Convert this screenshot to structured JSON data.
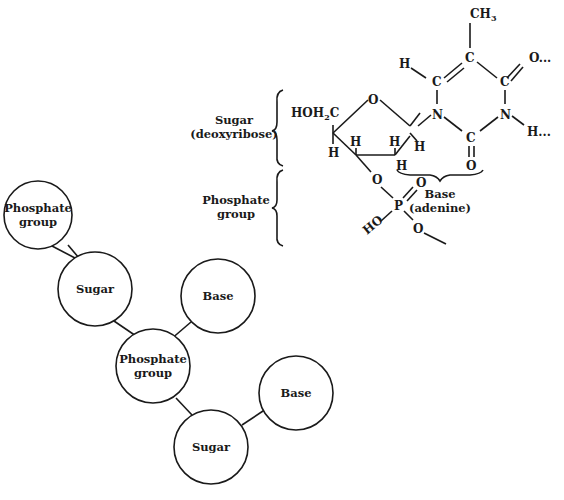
{
  "structural_formula": {
    "labels": {
      "sugar_line1": "Sugar",
      "sugar_line2": "(deoxyribose)",
      "phosphate_line1": "Phosphate",
      "phosphate_line2": "group",
      "base_line1": "Base",
      "base_line2": "(adenine)"
    },
    "atoms": {
      "hoh2c_a": "HOH",
      "hoh2c_sub": "2",
      "hoh2c_b": "C",
      "ring_o": "O",
      "h_c4_down": "H",
      "h_c3": "H",
      "h_c2_up": "H",
      "h_c2_down": "H",
      "h_c1": "H",
      "o3": "O",
      "p": "P",
      "p_o_double": "O",
      "ho": "HO",
      "o5": "O",
      "ch3_a": "CH",
      "ch3_sub": "3",
      "c5": "C",
      "c6": "C",
      "h6": "H",
      "n1": "N",
      "c2": "C",
      "o2": "O",
      "n3": "N",
      "h3": "H...",
      "c4": "C",
      "o4": "O..."
    }
  },
  "block_diagram": {
    "nodes": [
      {
        "id": "phosphate-1",
        "line1": "Phosphate",
        "line2": "group"
      },
      {
        "id": "sugar-1",
        "line1": "Sugar",
        "line2": ""
      },
      {
        "id": "base-1",
        "line1": "Base",
        "line2": ""
      },
      {
        "id": "phosphate-2",
        "line1": "Phosphate",
        "line2": "group"
      },
      {
        "id": "base-2",
        "line1": "Base",
        "line2": ""
      },
      {
        "id": "sugar-2",
        "line1": "Sugar",
        "line2": ""
      }
    ]
  }
}
